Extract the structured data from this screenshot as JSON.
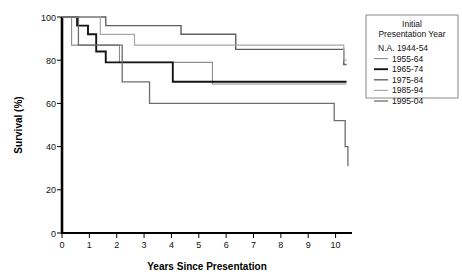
{
  "chart_data": {
    "type": "line",
    "title": "",
    "xlabel": "Years Since Presentation",
    "ylabel": "Survival (%)",
    "xlim": [
      0,
      10.6
    ],
    "ylim": [
      0,
      100
    ],
    "xticks": [
      0,
      1,
      2,
      3,
      4,
      5,
      6,
      7,
      8,
      9,
      10
    ],
    "xtick_labels": [
      "0",
      "1",
      "2",
      "3",
      "4",
      "5",
      "6",
      "7",
      "8",
      "9",
      "10"
    ],
    "yticks": [
      0,
      20,
      40,
      60,
      80,
      100
    ],
    "ytick_labels": [
      "0",
      "20",
      "40",
      "60",
      "80",
      "100"
    ],
    "grid": false,
    "step_type": "post",
    "legend_position": "right",
    "legend_title_line1": "Initial",
    "legend_title_line2": "Presentation Year",
    "series": [
      {
        "name": "1944-54",
        "label": "N.A. 1944-54",
        "marker_label": "N.A.",
        "has_line_swatch": false,
        "color": "#888888",
        "width": 1.0,
        "x": [],
        "y": []
      },
      {
        "name": "1955-64",
        "label": "1955-64",
        "has_line_swatch": true,
        "color": "#8d8d8d",
        "width": 1.1,
        "x": [
          0,
          0.35,
          1.7,
          2.1,
          3.0,
          5.5,
          8.1,
          9.9,
          10.25,
          10.4
        ],
        "y": [
          100,
          87,
          87,
          79,
          79,
          69,
          69,
          69,
          69,
          69
        ]
      },
      {
        "name": "1965-74",
        "label": "1965-74",
        "has_line_swatch": true,
        "color": "#141414",
        "width": 1.9,
        "x": [
          0,
          0.55,
          0.95,
          1.25,
          1.6,
          3.55,
          4.05,
          10.4
        ],
        "y": [
          100,
          96,
          92,
          84,
          79,
          79,
          70,
          70
        ]
      },
      {
        "name": "1975-84",
        "label": "1975-84",
        "has_line_swatch": true,
        "color": "#5e5e5e",
        "width": 1.4,
        "x": [
          0,
          1.2,
          1.6,
          3.9,
          4.35,
          5.85,
          6.35,
          7.9,
          8.35,
          10.1,
          10.3,
          10.4
        ],
        "y": [
          100,
          100,
          96,
          96,
          92,
          92,
          85,
          85,
          85,
          85,
          78,
          78
        ]
      },
      {
        "name": "1985-94",
        "label": "1985-94",
        "has_line_swatch": true,
        "color": "#a8a8a8",
        "width": 1.2,
        "x": [
          0,
          0.95,
          1.4,
          2.2,
          2.65,
          5.9,
          10.05,
          10.3,
          10.4
        ],
        "y": [
          100,
          100,
          92,
          92,
          87,
          87,
          87,
          80,
          80
        ]
      },
      {
        "name": "1995-04",
        "label": "1995-04",
        "has_line_swatch": true,
        "color": "#6d6d6d",
        "width": 1.3,
        "x": [
          0,
          0.6,
          1.05,
          2.2,
          2.6,
          3.2,
          3.55,
          9.95,
          10.15,
          10.35,
          10.45
        ],
        "y": [
          100,
          87,
          87,
          70,
          70,
          60,
          60,
          52,
          52,
          40,
          31
        ]
      }
    ]
  },
  "legend": {
    "title_line1": "Initial",
    "title_line2": "Presentation Year",
    "items": [
      {
        "label": "N.A. 1944-54",
        "swatch": false,
        "color": "#888888",
        "width": 1.0
      },
      {
        "label": "1955-64",
        "swatch": true,
        "color": "#8d8d8d",
        "width": 1.1
      },
      {
        "label": "1965-74",
        "swatch": true,
        "color": "#141414",
        "width": 1.9
      },
      {
        "label": "1975-84",
        "swatch": true,
        "color": "#5e5e5e",
        "width": 1.4
      },
      {
        "label": "1985-94",
        "swatch": true,
        "color": "#a8a8a8",
        "width": 1.2
      },
      {
        "label": "1995-04",
        "swatch": true,
        "color": "#6d6d6d",
        "width": 1.3
      }
    ]
  },
  "axes": {
    "x_title": "Years Since Presentation",
    "y_title": "Survival (%)"
  },
  "colors": {
    "axis": "#000000",
    "background": "#ffffff",
    "legend_border": "#8a8a8a",
    "text": "#111111"
  }
}
